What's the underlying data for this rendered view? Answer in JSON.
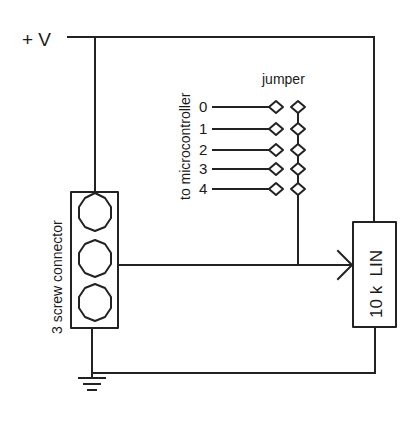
{
  "diagram": {
    "type": "circuit-schematic",
    "supply_label": "+ V",
    "jumper_label": "jumper",
    "microcontroller_label": "to microcontroller",
    "connector_label": "3 screw connector",
    "potentiometer_label": "10 k  LIN",
    "pins": [
      {
        "label": "0"
      },
      {
        "label": "1"
      },
      {
        "label": "2"
      },
      {
        "label": "3"
      },
      {
        "label": "4"
      }
    ],
    "ground_symbol": "ground",
    "colors": {
      "line": "#222222",
      "background": "#ffffff"
    }
  }
}
